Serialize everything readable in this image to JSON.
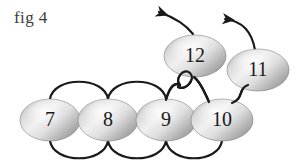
{
  "figure": {
    "caption": "fig 4",
    "background_color": "#ffffff",
    "stroke_color": "#1a1a1a",
    "node_fill_light": "#ececec",
    "node_fill_mid": "#c9c9c9",
    "node_fill_dark": "#8d8d8d",
    "label_color": "#1a1a1a"
  },
  "nodes": [
    {
      "id": "node-7",
      "label": "7",
      "cx": 50,
      "cy": 120,
      "rx": 30,
      "ry": 21
    },
    {
      "id": "node-8",
      "label": "8",
      "cx": 108,
      "cy": 120,
      "rx": 30,
      "ry": 21
    },
    {
      "id": "node-9",
      "label": "9",
      "cx": 166,
      "cy": 120,
      "rx": 30,
      "ry": 21
    },
    {
      "id": "node-10",
      "label": "10",
      "cx": 222,
      "cy": 120,
      "rx": 31,
      "ry": 21
    },
    {
      "id": "node-12",
      "label": "12",
      "cx": 195,
      "cy": 56,
      "rx": 31,
      "ry": 21
    },
    {
      "id": "node-11",
      "label": "11",
      "cx": 258,
      "cy": 70,
      "rx": 31,
      "ry": 21
    }
  ],
  "edges": [
    {
      "id": "edge-7-8-top",
      "from": "7",
      "to": "8",
      "side": "top",
      "path": "M 50 99 C 54 78, 104 78, 108 99"
    },
    {
      "id": "edge-8-9-top",
      "from": "8",
      "to": "9",
      "side": "top",
      "path": "M 108 99 C 112 78, 162 78, 166 99"
    },
    {
      "id": "edge-9-loop-top",
      "from": "9",
      "to": "12",
      "side": "top",
      "path": "M 166 99 C 170 80, 178 82, 182 86"
    },
    {
      "id": "edge-7-8-bottom",
      "from": "7",
      "to": "8",
      "side": "bottom",
      "path": "M 50 141 C 54 162, 104 162, 108 141"
    },
    {
      "id": "edge-8-9-bottom",
      "from": "8",
      "to": "9",
      "side": "bottom",
      "path": "M 108 141 C 112 162, 162 162, 166 141"
    },
    {
      "id": "edge-9-10-bottom",
      "from": "9",
      "to": "10",
      "side": "bottom",
      "path": "M 166 141 C 170 162, 218 162, 222 141"
    },
    {
      "id": "edge-10-12",
      "from": "10",
      "to": "12",
      "side": "top",
      "path": "M 210 101 C 204 86, 198 80, 194 78"
    },
    {
      "id": "edge-10-11",
      "from": "10",
      "to": "11",
      "side": "top",
      "path": "M 234 102 C 244 96, 240 90, 246 86"
    },
    {
      "id": "edge-loop",
      "from": "12",
      "to": "12",
      "side": "self",
      "path": "M 182 86 C 176 80, 186 70, 192 76 C 197 82, 186 92, 179 87"
    }
  ],
  "arrows": [
    {
      "id": "arrow-12-out",
      "from": "12",
      "direction": "up-left",
      "path": "M 192 35 C 184 26, 172 18, 156 12",
      "head_at": [
        156,
        12
      ]
    },
    {
      "id": "arrow-11-out",
      "from": "11",
      "direction": "up-left",
      "path": "M 254 49 C 250 32, 240 22, 222 19",
      "head_at": [
        222,
        19
      ]
    }
  ]
}
